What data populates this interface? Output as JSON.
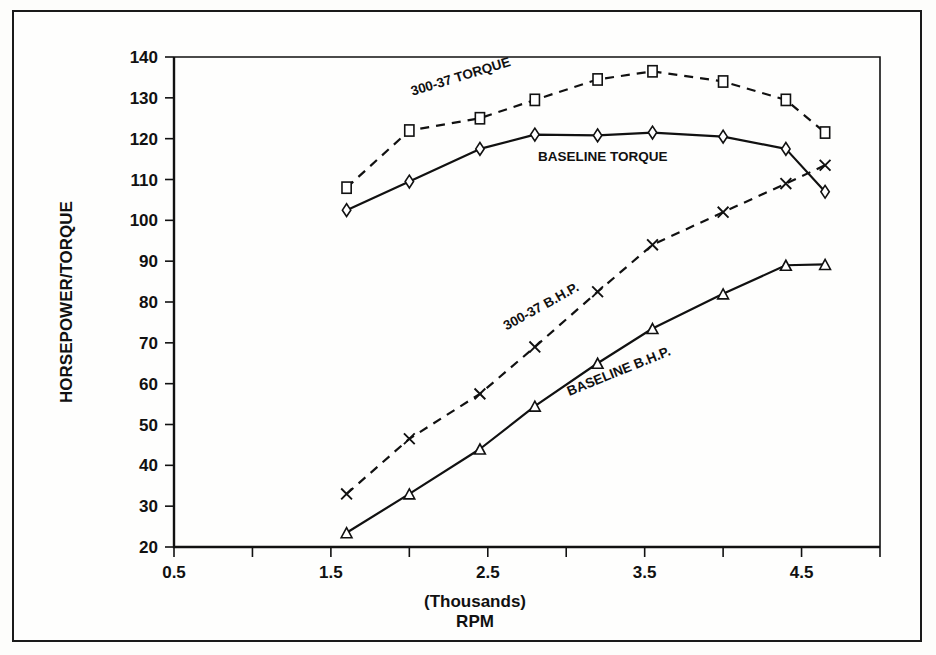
{
  "figure": {
    "background_color": "#fdfdfb",
    "frame_color": "#1a1a1a",
    "ink_color": "#111111"
  },
  "axes": {
    "y_title": "HORSEPOWER/TORQUE",
    "x_title_line1": "(Thousands)",
    "x_title_line2": "RPM",
    "y_ticks": [
      "20",
      "30",
      "40",
      "50",
      "60",
      "70",
      "80",
      "90",
      "100",
      "110",
      "120",
      "130",
      "140"
    ],
    "x_ticks": [
      "0.5",
      "1.5",
      "2.5",
      "3.5",
      "4.5"
    ]
  },
  "chart_data": {
    "type": "line",
    "title": "",
    "xlabel": "(Thousands) RPM",
    "ylabel": "HORSEPOWER/TORQUE",
    "xlim": [
      0.5,
      5.0
    ],
    "ylim": [
      20,
      140
    ],
    "grid": false,
    "legend": "inline-annotations",
    "x_tick_values": [
      0.5,
      1.5,
      2.5,
      3.5,
      4.5
    ],
    "x_minor_tick_values": [
      1.0,
      2.0,
      3.0,
      4.0,
      5.0
    ],
    "y_tick_values": [
      20,
      30,
      40,
      50,
      60,
      70,
      80,
      90,
      100,
      110,
      120,
      130,
      140
    ],
    "x": [
      1.6,
      2.0,
      2.45,
      2.8,
      3.2,
      3.55,
      4.0,
      4.4,
      4.65
    ],
    "series": [
      {
        "name": "300-37 TORQUE",
        "marker": "square",
        "style": "dashed",
        "label_x": 2.02,
        "label_y": 130.5,
        "label_rotation": -17,
        "values": [
          108,
          122,
          125,
          129.5,
          134.5,
          136.5,
          134,
          129.5,
          121.5
        ]
      },
      {
        "name": "BASELINE TORQUE",
        "marker": "diamond",
        "style": "solid",
        "label_x": 2.82,
        "label_y": 114.5,
        "label_rotation": 0,
        "values": [
          102.5,
          109.5,
          117.5,
          121,
          120.8,
          121.5,
          120.5,
          117.5,
          107
        ]
      },
      {
        "name": "300-37 B.H.P.",
        "marker": "x",
        "style": "dashed",
        "label_x": 2.62,
        "label_y": 73,
        "label_rotation": -29,
        "values": [
          33,
          46.5,
          57.5,
          69,
          82.5,
          94,
          102,
          109,
          113.5
        ]
      },
      {
        "name": "BASELINE B.H.P.",
        "marker": "triangle",
        "style": "solid",
        "label_x": 3.02,
        "label_y": 57,
        "label_rotation": -22,
        "values": [
          23.5,
          33,
          44,
          54.5,
          65,
          73.5,
          82,
          89,
          89.2
        ]
      }
    ]
  }
}
